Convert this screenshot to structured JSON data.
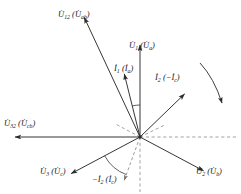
{
  "figure": {
    "type": "phasor-diagram",
    "background_color": "#ffffff",
    "line_color": "#2b2b2b",
    "dashed_color": "#8a8a8a",
    "origin": {
      "x": 140,
      "y": 137
    },
    "width": 241,
    "height": 194
  },
  "labels": {
    "u12": {
      "main": "U",
      "sub": "12",
      "paren_main": "U",
      "paren_sub": "ab",
      "text": "U̇₁₂ (U̇ab)",
      "x": 58,
      "y": 10
    },
    "u1": {
      "main": "U",
      "sub": "1",
      "paren_main": "U",
      "paren_sub": "a",
      "text": "U̇₁ (U̇a)",
      "x": 129,
      "y": 41
    },
    "i1": {
      "main": "I",
      "sub": "1",
      "paren_main": "I",
      "paren_sub": "a",
      "text": "İ₁ (İa)",
      "x": 114,
      "y": 64
    },
    "i2": {
      "main": "I",
      "sub": "2",
      "paren_main": "-I",
      "paren_sub": "c",
      "text": "İ₂ (−İc)",
      "x": 155,
      "y": 73
    },
    "u32": {
      "main": "U",
      "sub": "32",
      "paren_main": "U",
      "paren_sub": "cb",
      "text": "U̇₃₂ (U̇cb)",
      "x": 4,
      "y": 119
    },
    "u3": {
      "main": "U",
      "sub": "3",
      "paren_main": "U",
      "paren_sub": "c",
      "text": "U̇₃ (U̇c)",
      "x": 40,
      "y": 167
    },
    "ni2": {
      "main": "-I",
      "sub": "2",
      "paren_main": "I",
      "paren_sub": "c",
      "text": "−İ₂ (İc)",
      "x": 92,
      "y": 175
    },
    "u2": {
      "main": "U",
      "sub": "2",
      "paren_main": "U",
      "paren_sub": "b",
      "text": "U̇₂ (U̇b)",
      "x": 196,
      "y": 167
    }
  },
  "vectors": [
    {
      "name": "u12",
      "angle_deg": 115,
      "length": 132,
      "style": "solid",
      "label_key": "u12"
    },
    {
      "name": "u1",
      "angle_deg": 90,
      "length": 92,
      "style": "solid",
      "label_key": "u1"
    },
    {
      "name": "i1",
      "angle_deg": 104,
      "length": 65,
      "style": "solid",
      "label_key": "i1"
    },
    {
      "name": "i2",
      "angle_deg": 44,
      "length": 62,
      "style": "solid",
      "label_key": "i2"
    },
    {
      "name": "u32",
      "angle_deg": 180,
      "length": 125,
      "style": "solid",
      "label_key": "u32"
    },
    {
      "name": "u3",
      "angle_deg": 208,
      "length": 78,
      "style": "solid",
      "label_key": "u3"
    },
    {
      "name": "u2",
      "angle_deg": 332,
      "length": 72,
      "style": "solid",
      "label_key": "u2"
    },
    {
      "name": "ni2",
      "angle_deg": 250,
      "length": 46,
      "style": "dashed",
      "label_key": "ni2"
    }
  ],
  "reference_lines": [
    {
      "name": "axis-right",
      "angle_deg": 0,
      "length": 98,
      "style": "dashed"
    },
    {
      "name": "axis-down",
      "angle_deg": 270,
      "length": 55,
      "style": "dashed"
    },
    {
      "name": "stub-upleft",
      "angle_deg": 152,
      "length": 28,
      "style": "dashed"
    },
    {
      "name": "stub-upright",
      "angle_deg": 26,
      "length": 28,
      "style": "dashed"
    }
  ],
  "angle_arcs": [
    {
      "name": "phi-upper",
      "from_deg": 90,
      "to_deg": 104,
      "radius": 32
    },
    {
      "name": "phi-lower",
      "from_deg": 208,
      "to_deg": 250,
      "radius": 40
    }
  ],
  "rotation_arrow": {
    "name": "rotation-direction",
    "direction": "clockwise",
    "x": 205,
    "y": 60
  }
}
